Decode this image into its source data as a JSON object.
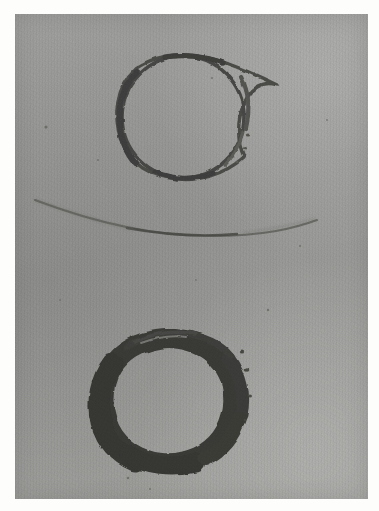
{
  "figure": {
    "name": "specimen-plate",
    "medium": "grayscale-photographic-print",
    "description": "Grayscale photographic plate showing two dark irregular rings on a grainy gray field with a faint curved arc between them",
    "page_background_color": "#fdfdfc",
    "print_background_color": "#9c9c9a",
    "ink_color": "#3a3a38",
    "print_area": {
      "x": 15,
      "y": 14,
      "width": 353,
      "height": 485
    }
  },
  "objects": [
    {
      "id": "upper-ring",
      "label": "upper ring",
      "shape": "irregular annulus",
      "center_x": 183,
      "center_y": 117,
      "radius": 62,
      "stroke_min": 3,
      "stroke_max": 8,
      "tone": "thin dark outline, slightly heavier on the left and lower-left",
      "color": "#4a4a47"
    },
    {
      "id": "median-arc",
      "label": "faint curved arc",
      "shape": "shallow concave-up arc",
      "x_start": 35,
      "y_start": 200,
      "x_end": 312,
      "y_end": 221,
      "sag_y": 234,
      "stroke": 2,
      "tone": "faint, fading at both ends",
      "color": "#5c5c59"
    },
    {
      "id": "lower-ring",
      "label": "lower ring",
      "shape": "irregular annulus",
      "center_x": 167,
      "center_y": 395,
      "radius": 64,
      "stroke_min": 5,
      "stroke_max": 22,
      "tone": "heavy dark band, thickest along the left and bottom, thin and doubled across the top",
      "color": "#3a3a37"
    }
  ],
  "speckles": [
    {
      "x": 46,
      "y": 127,
      "r": 1.6
    },
    {
      "x": 212,
      "y": 78,
      "r": 1.1
    },
    {
      "x": 244,
      "y": 148,
      "r": 1.2
    },
    {
      "x": 98,
      "y": 160,
      "r": 1.0
    },
    {
      "x": 300,
      "y": 246,
      "r": 1.1
    },
    {
      "x": 327,
      "y": 120,
      "r": 1.0
    },
    {
      "x": 268,
      "y": 310,
      "r": 1.2
    },
    {
      "x": 150,
      "y": 489,
      "r": 1.0
    },
    {
      "x": 245,
      "y": 420,
      "r": 1.1
    },
    {
      "x": 60,
      "y": 300,
      "r": 0.9
    },
    {
      "x": 196,
      "y": 280,
      "r": 0.9
    },
    {
      "x": 128,
      "y": 478,
      "r": 1.3
    }
  ]
}
